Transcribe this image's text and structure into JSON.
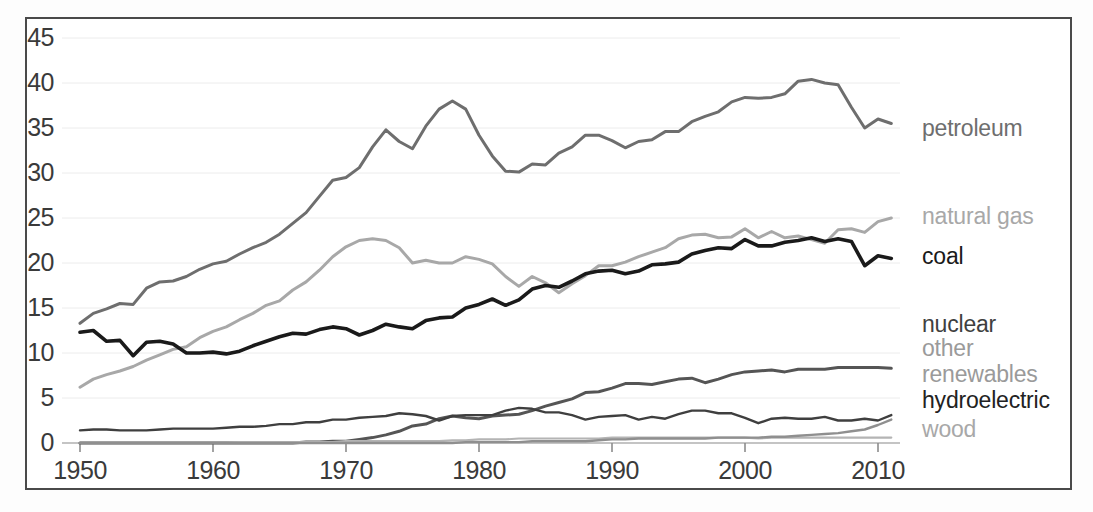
{
  "chart_data": {
    "type": "line",
    "title": "",
    "subtitle": "",
    "xlabel": "",
    "ylabel": "",
    "xlim": [
      1949,
      2012
    ],
    "ylim": [
      0,
      45
    ],
    "yticks": [
      0,
      5,
      10,
      15,
      20,
      25,
      30,
      35,
      40,
      45
    ],
    "xticks": [
      1950,
      1960,
      1970,
      1980,
      1990,
      2000,
      2010
    ],
    "grid": true,
    "legend_position": "right-inline-end-of-line",
    "x": [
      1950,
      1951,
      1952,
      1953,
      1954,
      1955,
      1956,
      1957,
      1958,
      1959,
      1960,
      1961,
      1962,
      1963,
      1964,
      1965,
      1966,
      1967,
      1968,
      1969,
      1970,
      1971,
      1972,
      1973,
      1974,
      1975,
      1976,
      1977,
      1978,
      1979,
      1980,
      1981,
      1982,
      1983,
      1984,
      1985,
      1986,
      1987,
      1988,
      1989,
      1990,
      1991,
      1992,
      1993,
      1994,
      1995,
      1996,
      1997,
      1998,
      1999,
      2000,
      2001,
      2002,
      2003,
      2004,
      2005,
      2006,
      2007,
      2008,
      2009,
      2010,
      2011
    ],
    "series": [
      {
        "name": "petroleum",
        "color": "#6e6e6e",
        "width": 3.0,
        "label": "petroleum",
        "values": [
          13.3,
          14.4,
          14.9,
          15.5,
          15.4,
          17.2,
          17.9,
          18.0,
          18.5,
          19.3,
          19.9,
          20.2,
          21.0,
          21.7,
          22.3,
          23.2,
          24.4,
          25.6,
          27.4,
          29.2,
          29.5,
          30.6,
          32.9,
          34.8,
          33.5,
          32.7,
          35.2,
          37.1,
          38.0,
          37.1,
          34.2,
          31.9,
          30.2,
          30.1,
          31.0,
          30.9,
          32.2,
          32.9,
          34.2,
          34.2,
          33.6,
          32.8,
          33.5,
          33.7,
          34.6,
          34.6,
          35.7,
          36.3,
          36.8,
          37.9,
          38.4,
          38.3,
          38.4,
          38.8,
          40.2,
          40.4,
          40.0,
          39.8,
          37.3,
          35.0,
          36.0,
          35.5
        ]
      },
      {
        "name": "natural_gas",
        "color": "#a8a8a8",
        "width": 3.0,
        "label": "natural gas",
        "values": [
          6.2,
          7.1,
          7.6,
          8.0,
          8.5,
          9.2,
          9.8,
          10.4,
          10.7,
          11.7,
          12.4,
          12.9,
          13.7,
          14.4,
          15.3,
          15.8,
          17.0,
          17.9,
          19.2,
          20.7,
          21.8,
          22.5,
          22.7,
          22.5,
          21.7,
          20.0,
          20.3,
          20.0,
          20.0,
          20.7,
          20.4,
          19.9,
          18.5,
          17.4,
          18.5,
          17.8,
          16.7,
          17.7,
          18.6,
          19.7,
          19.7,
          20.1,
          20.7,
          21.2,
          21.7,
          22.7,
          23.1,
          23.2,
          22.8,
          22.9,
          23.8,
          22.8,
          23.5,
          22.8,
          23.0,
          22.6,
          22.2,
          23.7,
          23.8,
          23.4,
          24.6,
          25.0
        ]
      },
      {
        "name": "coal",
        "color": "#1a1a1a",
        "width": 3.6,
        "label": "coal",
        "values": [
          12.3,
          12.5,
          11.3,
          11.4,
          9.7,
          11.2,
          11.3,
          11.0,
          10.0,
          10.0,
          10.1,
          9.9,
          10.2,
          10.8,
          11.3,
          11.8,
          12.2,
          12.1,
          12.6,
          12.9,
          12.7,
          12.0,
          12.5,
          13.2,
          12.9,
          12.7,
          13.6,
          13.9,
          14.0,
          15.0,
          15.4,
          16.0,
          15.3,
          15.9,
          17.1,
          17.5,
          17.3,
          18.0,
          18.8,
          19.1,
          19.2,
          18.8,
          19.1,
          19.8,
          19.9,
          20.1,
          21.0,
          21.4,
          21.7,
          21.6,
          22.6,
          21.9,
          21.9,
          22.3,
          22.5,
          22.8,
          22.4,
          22.7,
          22.4,
          19.7,
          20.8,
          20.5
        ]
      },
      {
        "name": "nuclear",
        "color": "#555555",
        "width": 3.0,
        "label": "nuclear",
        "values": [
          0.0,
          0.0,
          0.0,
          0.0,
          0.0,
          0.0,
          0.0,
          0.0,
          0.0,
          0.0,
          0.0,
          0.0,
          0.0,
          0.0,
          0.0,
          0.0,
          0.0,
          0.1,
          0.1,
          0.2,
          0.2,
          0.4,
          0.6,
          0.9,
          1.3,
          1.9,
          2.1,
          2.7,
          3.0,
          2.8,
          2.7,
          3.0,
          3.1,
          3.2,
          3.6,
          4.1,
          4.5,
          4.9,
          5.6,
          5.7,
          6.1,
          6.6,
          6.6,
          6.5,
          6.8,
          7.1,
          7.2,
          6.7,
          7.1,
          7.6,
          7.9,
          8.0,
          8.1,
          7.9,
          8.2,
          8.2,
          8.2,
          8.4,
          8.4,
          8.4,
          8.4,
          8.3
        ]
      },
      {
        "name": "hydroelectric",
        "color": "#3f3f3f",
        "width": 2.4,
        "label": "hydroelectric",
        "values": [
          1.4,
          1.5,
          1.5,
          1.4,
          1.4,
          1.4,
          1.5,
          1.6,
          1.6,
          1.6,
          1.6,
          1.7,
          1.8,
          1.8,
          1.9,
          2.1,
          2.1,
          2.3,
          2.3,
          2.6,
          2.6,
          2.8,
          2.9,
          3.0,
          3.3,
          3.2,
          3.0,
          2.5,
          3.0,
          3.1,
          3.1,
          3.1,
          3.6,
          3.9,
          3.8,
          3.4,
          3.4,
          3.1,
          2.6,
          2.9,
          3.0,
          3.1,
          2.6,
          2.9,
          2.7,
          3.2,
          3.6,
          3.6,
          3.3,
          3.3,
          2.8,
          2.2,
          2.7,
          2.8,
          2.7,
          2.7,
          2.9,
          2.5,
          2.5,
          2.7,
          2.5,
          3.1
        ]
      },
      {
        "name": "wood",
        "color": "#b4b4b4",
        "width": 2.2,
        "label": "wood",
        "values": [
          0.0,
          0.0,
          0.0,
          0.0,
          0.0,
          0.0,
          0.0,
          0.0,
          0.0,
          0.0,
          0.0,
          0.0,
          0.1,
          0.1,
          0.1,
          0.1,
          0.1,
          0.1,
          0.1,
          0.1,
          0.2,
          0.2,
          0.2,
          0.2,
          0.2,
          0.2,
          0.2,
          0.2,
          0.3,
          0.3,
          0.4,
          0.4,
          0.4,
          0.5,
          0.5,
          0.5,
          0.5,
          0.5,
          0.5,
          0.5,
          0.6,
          0.6,
          0.6,
          0.6,
          0.6,
          0.6,
          0.6,
          0.6,
          0.6,
          0.6,
          0.6,
          0.5,
          0.6,
          0.6,
          0.6,
          0.6,
          0.6,
          0.6,
          0.6,
          0.6,
          0.6,
          0.6
        ]
      },
      {
        "name": "other_renewables",
        "color": "#8f8f8f",
        "width": 2.4,
        "label": "other renewables",
        "values": [
          0.0,
          0.0,
          0.0,
          0.0,
          0.0,
          0.0,
          0.0,
          0.0,
          0.0,
          0.0,
          0.0,
          0.0,
          0.0,
          0.0,
          0.0,
          0.0,
          0.0,
          0.0,
          0.0,
          0.0,
          0.0,
          0.0,
          0.0,
          0.0,
          0.0,
          0.0,
          0.0,
          0.0,
          0.0,
          0.1,
          0.1,
          0.1,
          0.1,
          0.1,
          0.2,
          0.2,
          0.2,
          0.2,
          0.2,
          0.3,
          0.4,
          0.4,
          0.5,
          0.5,
          0.5,
          0.5,
          0.5,
          0.5,
          0.6,
          0.6,
          0.6,
          0.6,
          0.7,
          0.7,
          0.8,
          0.9,
          1.0,
          1.1,
          1.3,
          1.5,
          2.0,
          2.6
        ]
      }
    ]
  },
  "axis": {
    "yticks": [
      "45",
      "40",
      "35",
      "30",
      "25",
      "20",
      "15",
      "10",
      "5",
      "0"
    ],
    "xticks": [
      "1950",
      "1960",
      "1970",
      "1980",
      "1990",
      "2000",
      "2010"
    ]
  },
  "legend": {
    "items": [
      {
        "label": "petroleum",
        "color": "#6e6e6e",
        "top": 117
      },
      {
        "label": "natural gas",
        "color": "#a8a8a8",
        "top": 205
      },
      {
        "label": "coal",
        "color": "#1a1a1a",
        "top": 245
      },
      {
        "label": "nuclear",
        "color": "#3f3f3f",
        "top": 313
      },
      {
        "label": "other",
        "color": "#9a9a9a",
        "top": 337
      },
      {
        "label": "renewables",
        "color": "#9a9a9a",
        "top": 363
      },
      {
        "label": "hydroelectric",
        "color": "#222222",
        "top": 389
      },
      {
        "label": "wood",
        "color": "#a8a8a8",
        "top": 418
      }
    ]
  },
  "colors": {
    "frame_border": "#4a4a4a",
    "gridline": "#ececec",
    "background": "#ffffff",
    "tick_text": "#3a3a3a"
  }
}
